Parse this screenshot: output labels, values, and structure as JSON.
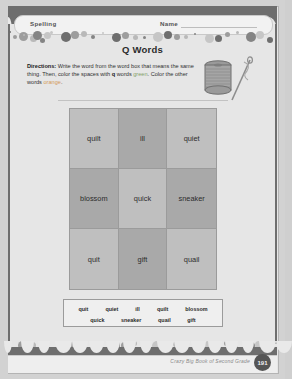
{
  "header": {
    "subject_label": "Spelling",
    "name_label": "Name"
  },
  "title": "Q Words",
  "directions": {
    "lead": "Directions:",
    "part1": " Write the word from the word box that means the same thing. Then, color the spaces with ",
    "bold_q": "q",
    "part2": " words ",
    "green_word": "green",
    "part3": ". Color the other words ",
    "orange_word": "orange",
    "part4": "."
  },
  "illustration": {
    "name": "spool-of-thread-and-needle-illustration"
  },
  "grid": {
    "rows": 3,
    "cols": 3,
    "cells": [
      {
        "text": "quilt",
        "shade": "light"
      },
      {
        "text": "ill",
        "shade": "dark"
      },
      {
        "text": "quiet",
        "shade": "light"
      },
      {
        "text": "blossom",
        "shade": "dark"
      },
      {
        "text": "quick",
        "shade": "light"
      },
      {
        "text": "sneaker",
        "shade": "dark"
      },
      {
        "text": "quit",
        "shade": "light"
      },
      {
        "text": "gift",
        "shade": "dark"
      },
      {
        "text": "quail",
        "shade": "light"
      }
    ]
  },
  "word_box": {
    "row1": [
      "quit",
      "quiet",
      "ill",
      "quilt",
      "blossom"
    ],
    "row2": [
      "quick",
      "sneaker",
      "quail",
      "gift"
    ]
  },
  "footer": {
    "book_title": "Crazy Big Book of Second Grade",
    "page_number": "191"
  },
  "colors": {
    "green": "#7fa06a",
    "orange": "#d49a5a",
    "band": "#6e6e6e",
    "cell_light": "#bfbfbf",
    "cell_dark": "#a9a9a9"
  }
}
